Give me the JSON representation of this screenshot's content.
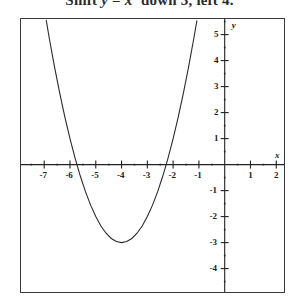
{
  "caption": {
    "prefix": "Shift ",
    "equation_y": "y",
    "equals": " = ",
    "equation_x": "x",
    "exponent": "2",
    "suffix": " down 3, left 4."
  },
  "axes": {
    "x_axis_name": "x",
    "y_axis_name": "y",
    "x_tick_labels": [
      "-7",
      "-6",
      "-5",
      "-4",
      "-3",
      "-2",
      "-1",
      "1",
      "2"
    ],
    "x_tick_values": [
      -7,
      -6,
      -5,
      -4,
      -3,
      -2,
      -1,
      1,
      2
    ],
    "y_tick_labels": [
      "5",
      "4",
      "3",
      "2",
      "1",
      "-1",
      "-2",
      "-3",
      "-4"
    ],
    "y_tick_values": [
      5,
      4,
      3,
      2,
      1,
      -1,
      -2,
      -3,
      -4
    ]
  },
  "chart_data": {
    "type": "line",
    "xlabel": "x",
    "ylabel": "y",
    "xlim": [
      -7.9,
      2.3
    ],
    "ylim": [
      -4.9,
      5.6
    ],
    "grid": false,
    "legend": "none",
    "curve_color": "#2b2b2b",
    "axis_color": "#222222",
    "frame_color": "#3a3a3a",
    "background": "#ffffff",
    "series": [
      {
        "name": "y = (x + 4)^2 - 3",
        "equation": "y = (x + 4)² - 3",
        "vertex": [
          -4,
          -3
        ],
        "roots": [
          -5.732,
          -2.268
        ],
        "x": [
          -6.92,
          -6.8,
          -6.6,
          -6.4,
          -6.2,
          -6.0,
          -5.8,
          -5.6,
          -5.4,
          -5.2,
          -5.0,
          -4.8,
          -4.6,
          -4.4,
          -4.2,
          -4.0,
          -3.8,
          -3.6,
          -3.4,
          -3.2,
          -3.0,
          -2.8,
          -2.6,
          -2.4,
          -2.2,
          -2.0,
          -1.8,
          -1.6,
          -1.4,
          -1.2,
          -1.08
        ],
        "y": [
          5.55,
          4.84,
          3.76,
          2.76,
          1.84,
          1.0,
          0.24,
          -0.44,
          -1.04,
          -1.56,
          -2.0,
          -2.36,
          -2.64,
          -2.84,
          -2.96,
          -3.0,
          -2.96,
          -2.84,
          -2.64,
          -2.36,
          -2.0,
          -1.56,
          -1.04,
          -0.44,
          0.24,
          1.0,
          1.84,
          2.76,
          3.76,
          4.84,
          5.53
        ]
      }
    ],
    "minor_tick_step": 0.5,
    "major_tick_step": 1
  }
}
